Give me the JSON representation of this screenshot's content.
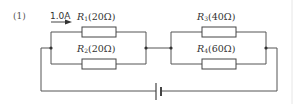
{
  "problem": {
    "number": "(1)"
  },
  "current": {
    "value": "1.0A"
  },
  "resistors": [
    {
      "symbol": "R",
      "sub": "1",
      "value": "(20Ω)"
    },
    {
      "symbol": "R",
      "sub": "2",
      "value": "(20Ω)"
    },
    {
      "symbol": "R",
      "sub": "3",
      "value": "(40Ω)"
    },
    {
      "symbol": "R",
      "sub": "4",
      "value": "(60Ω)"
    }
  ],
  "colors": {
    "wire": "#555555",
    "text": "#333333",
    "background": "#ffffff",
    "page_edge": "#e6e6e6"
  }
}
